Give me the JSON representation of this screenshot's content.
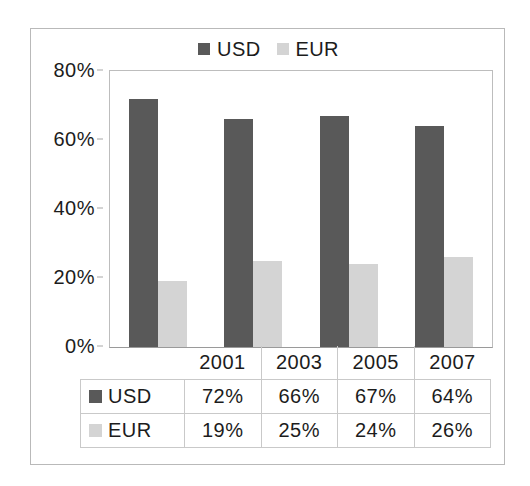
{
  "chart_data": {
    "type": "bar",
    "title": "",
    "xlabel": "",
    "ylabel": "",
    "categories": [
      "2001",
      "2003",
      "2005",
      "2007"
    ],
    "series": [
      {
        "name": "USD",
        "values": [
          72,
          66,
          67,
          64
        ],
        "color": "#595959",
        "labels": [
          "72%",
          "66%",
          "67%",
          "64%"
        ]
      },
      {
        "name": "EUR",
        "values": [
          19,
          25,
          24,
          26
        ],
        "color": "#d4d4d4",
        "labels": [
          "19%",
          "25%",
          "24%",
          "26%"
        ]
      }
    ],
    "ylim": [
      0,
      80
    ],
    "yticks": [
      0,
      20,
      40,
      60,
      80
    ],
    "ytick_labels": [
      "0%",
      "20%",
      "40%",
      "60%",
      "80%"
    ],
    "grid": false,
    "legend_position": "top-center"
  },
  "legend": {
    "entries": [
      {
        "label": "USD",
        "color": "#595959"
      },
      {
        "label": "EUR",
        "color": "#d4d4d4"
      }
    ]
  },
  "table": {
    "header": {
      "corner": "",
      "years": [
        "2001",
        "2003",
        "2005",
        "2007"
      ]
    },
    "rows": [
      {
        "key": "USD",
        "color": "#595959",
        "values": [
          "72%",
          "66%",
          "67%",
          "64%"
        ]
      },
      {
        "key": "EUR",
        "color": "#d4d4d4",
        "values": [
          "19%",
          "25%",
          "24%",
          "26%"
        ]
      }
    ]
  },
  "axis": {
    "ytick_labels": [
      "80%",
      "60%",
      "40%",
      "20%",
      "0%"
    ]
  }
}
